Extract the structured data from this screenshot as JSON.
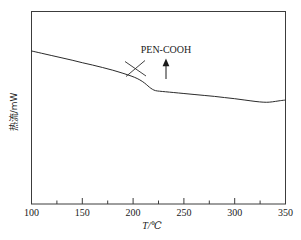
{
  "chart_data": {
    "type": "line",
    "title": "",
    "subtitle": "",
    "xlabel": "T/℃",
    "ylabel": "热流/mW",
    "xlim": [
      100,
      350
    ],
    "ylim": [
      0,
      1
    ],
    "grid": false,
    "legend": null,
    "x_ticks_major": [
      100,
      150,
      200,
      250,
      300,
      350
    ],
    "x_tick_labels": [
      "100",
      "150",
      "200",
      "250",
      "300",
      "350"
    ],
    "x_ticks_minor": [
      125,
      175,
      225,
      275,
      325
    ],
    "y_ticks_major": [],
    "y_tick_labels": [],
    "series": [
      {
        "name": "PEN-COOH DSC heat flow",
        "x": [
          100,
          110,
          120,
          130,
          140,
          150,
          160,
          170,
          180,
          190,
          198,
          204,
          209,
          213,
          216,
          219,
          222,
          226,
          232,
          240,
          250,
          260,
          270,
          280,
          290,
          300,
          310,
          320,
          328,
          334,
          340,
          345,
          350
        ],
        "y": [
          0.795,
          0.783,
          0.771,
          0.759,
          0.747,
          0.734,
          0.722,
          0.709,
          0.695,
          0.679,
          0.665,
          0.652,
          0.637,
          0.621,
          0.607,
          0.596,
          0.589,
          0.586,
          0.583,
          0.579,
          0.574,
          0.569,
          0.564,
          0.559,
          0.553,
          0.547,
          0.54,
          0.533,
          0.529,
          0.529,
          0.533,
          0.537,
          0.54
        ]
      }
    ],
    "annotations": [
      {
        "name": "sample-label",
        "text": "PEN-COOH",
        "x": 238,
        "y_frac": 0.84
      },
      {
        "name": "transition-arrow",
        "text": "",
        "x": 238,
        "points_to_x": 238
      },
      {
        "name": "tangent-construction",
        "text": "",
        "x": 215,
        "description": "onset tangent lines crossing at glass transition"
      }
    ]
  },
  "axes": {
    "x_axis_name": "temperature-axis",
    "y_axis_name": "heat-flow-axis"
  }
}
